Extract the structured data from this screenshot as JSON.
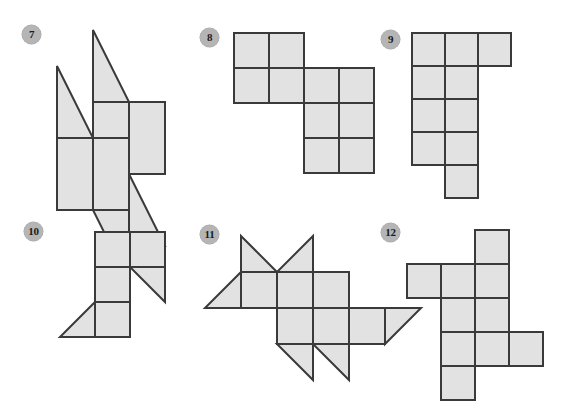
{
  "page": {
    "kind": "geometry-worksheet-figures",
    "background_color": "#ffffff",
    "width": 567,
    "height": 416
  },
  "style": {
    "face_fill": "#e2e2e2",
    "stroke_color": "#3a3a3a",
    "stroke_width": 2,
    "badge_fill": "#b5b5b5",
    "badge_text_color": "#1a1a1a"
  },
  "figures": [
    {
      "number": "7",
      "badge_label": "7",
      "badge_x": 22,
      "badge_y": 25,
      "cell": 36,
      "origin_x": 55,
      "origin_y": 28,
      "description": "net of squares and right triangles forming a pinwheel",
      "pieces": [
        {
          "name": "triangle-top",
          "type": "triangle",
          "points": "1,0 1,2 2,2"
        },
        {
          "name": "square-top-center",
          "type": "square",
          "points": "1,2 2,2 2,4 1,4"
        },
        {
          "name": "square-top-right",
          "type": "square",
          "points": "2,2 3,2 3,4 2,4"
        },
        {
          "name": "triangle-upper-left",
          "type": "triangle",
          "points": "0,1 1,3 0,3"
        },
        {
          "name": "square-mid-left",
          "type": "square",
          "points": "0,3 1,3 1,5 0,5"
        },
        {
          "name": "square-mid-center",
          "type": "square",
          "points": "1,3 2,3 2,5 1,5"
        },
        {
          "name": "triangle-right",
          "type": "triangle",
          "points": "2,4 3,6 2,6"
        },
        {
          "name": "triangle-bottom",
          "type": "triangle",
          "points": "1,5 2,5 2,7"
        }
      ]
    },
    {
      "number": "8",
      "badge_label": "8",
      "badge_x": 200,
      "badge_y": 28,
      "cell": 35,
      "origin_x": 232,
      "origin_y": 31,
      "description": "net of six squares in a staircase arrangement",
      "pieces": [
        {
          "name": "square-r0c0",
          "type": "square",
          "points": "0,0 1,0 1,1 0,1"
        },
        {
          "name": "square-r0c1",
          "type": "square",
          "points": "1,0 2,0 2,1 1,1"
        },
        {
          "name": "square-r1c0",
          "type": "square",
          "points": "0,1 1,1 1,2 0,2"
        },
        {
          "name": "square-r1c1",
          "type": "square",
          "points": "1,1 2,1 2,2 1,2"
        },
        {
          "name": "square-r1c2",
          "type": "square",
          "points": "2,1 3,1 3,2 2,2"
        },
        {
          "name": "square-r1c3",
          "type": "square",
          "points": "3,1 4,1 4,2 3,2"
        },
        {
          "name": "square-r2c2",
          "type": "square",
          "points": "2,2 3,2 3,3 2,3"
        },
        {
          "name": "square-r2c3",
          "type": "square",
          "points": "3,2 4,2 4,3 3,3"
        },
        {
          "name": "square-r3c2",
          "type": "square",
          "points": "2,3 3,3 3,4 2,4"
        },
        {
          "name": "square-r3c3",
          "type": "square",
          "points": "3,3 4,3 4,4 3,4"
        }
      ]
    },
    {
      "number": "9",
      "badge_label": "9",
      "badge_x": 381,
      "badge_y": 30,
      "cell": 33,
      "origin_x": 410,
      "origin_y": 31,
      "description": "net of squares: three across the top, a two-wide column, and one bottom square",
      "pieces": [
        {
          "name": "square-r0c0",
          "type": "square",
          "points": "0,0 1,0 1,1 0,1"
        },
        {
          "name": "square-r0c1",
          "type": "square",
          "points": "1,0 2,0 2,1 1,1"
        },
        {
          "name": "square-r0c2",
          "type": "square",
          "points": "2,0 3,0 3,1 2,1"
        },
        {
          "name": "square-r1c0",
          "type": "square",
          "points": "0,1 1,1 1,2 0,2"
        },
        {
          "name": "square-r1c1",
          "type": "square",
          "points": "1,1 2,1 2,2 1,2"
        },
        {
          "name": "square-r2c0",
          "type": "square",
          "points": "0,2 1,2 1,3 0,3"
        },
        {
          "name": "square-r2c1",
          "type": "square",
          "points": "1,2 2,2 2,3 1,3"
        },
        {
          "name": "square-r3c0",
          "type": "square",
          "points": "0,3 1,3 1,4 0,4"
        },
        {
          "name": "square-r3c1",
          "type": "square",
          "points": "1,3 2,3 2,4 1,4"
        },
        {
          "name": "square-r4c1",
          "type": "square",
          "points": "1,4 2,4 2,5 1,5"
        }
      ]
    },
    {
      "number": "10",
      "badge_label": "10",
      "badge_x": 24,
      "badge_y": 222,
      "cell": 35,
      "origin_x": 58,
      "origin_y": 230,
      "description": "net of four squares with two right triangles",
      "pieces": [
        {
          "name": "square-top-left",
          "type": "square",
          "points": "1,0 2,0 2,1 1,1"
        },
        {
          "name": "square-top-right",
          "type": "square",
          "points": "2,0 3,0 3,1 2,1"
        },
        {
          "name": "square-middle",
          "type": "square",
          "points": "1,1 2,1 2,2 1,2"
        },
        {
          "name": "triangle-right",
          "type": "triangle",
          "points": "2,1 3,1 3,2"
        },
        {
          "name": "triangle-bottom-left",
          "type": "triangle",
          "points": "1,2 1,3 0,3"
        },
        {
          "name": "square-bottom",
          "type": "square",
          "points": "1,2 2,2 2,3 1,3"
        }
      ]
    },
    {
      "number": "11",
      "badge_label": "11",
      "badge_x": 200,
      "badge_y": 225,
      "cell": 36,
      "origin_x": 203,
      "origin_y": 234,
      "description": "net of squares with four triangular flaps forming a star-like shape",
      "pieces": [
        {
          "name": "triangle-top-left-flap",
          "type": "triangle",
          "points": "1,0 2,1 1,1"
        },
        {
          "name": "triangle-top-right-flap",
          "type": "triangle",
          "points": "3,0 3,1 2,1"
        },
        {
          "name": "triangle-left-flap",
          "type": "triangle",
          "points": "1,1 1,2 0,2"
        },
        {
          "name": "square-r1c1",
          "type": "square",
          "points": "1,1 2,1 2,2 1,2"
        },
        {
          "name": "square-r1c2",
          "type": "square",
          "points": "2,1 3,1 3,2 2,2"
        },
        {
          "name": "square-r1c3",
          "type": "square",
          "points": "3,1 4,1 4,2 3,2"
        },
        {
          "name": "square-r2c2",
          "type": "square",
          "points": "2,2 3,2 3,3 2,3"
        },
        {
          "name": "square-r2c3",
          "type": "square",
          "points": "3,2 4,2 4,3 3,3"
        },
        {
          "name": "square-r2c4",
          "type": "square",
          "points": "4,2 5,2 5,3 4,3"
        },
        {
          "name": "triangle-right-flap",
          "type": "triangle",
          "points": "5,2 6,2 5,3"
        },
        {
          "name": "triangle-bottom-left-flap",
          "type": "triangle",
          "points": "3,3 3,4 2,3"
        },
        {
          "name": "triangle-bottom-right-flap",
          "type": "triangle",
          "points": "3,3 4,3 4,4"
        }
      ]
    },
    {
      "number": "12",
      "badge_label": "12",
      "badge_x": 381,
      "badge_y": 223,
      "cell": 34,
      "origin_x": 405,
      "origin_y": 228,
      "description": "net of ten squares in a cross-like arrangement",
      "pieces": [
        {
          "name": "square-r0c2",
          "type": "square",
          "points": "2,0 3,0 3,1 2,1"
        },
        {
          "name": "square-r1c0",
          "type": "square",
          "points": "0,1 1,1 1,2 0,2"
        },
        {
          "name": "square-r1c1",
          "type": "square",
          "points": "1,1 2,1 2,2 1,2"
        },
        {
          "name": "square-r1c2",
          "type": "square",
          "points": "2,1 3,1 3,2 2,2"
        },
        {
          "name": "square-r2c1",
          "type": "square",
          "points": "1,2 2,2 2,3 1,3"
        },
        {
          "name": "square-r2c2",
          "type": "square",
          "points": "2,2 3,2 3,3 2,3"
        },
        {
          "name": "square-r3c1",
          "type": "square",
          "points": "1,3 2,3 2,4 1,4"
        },
        {
          "name": "square-r3c2",
          "type": "square",
          "points": "2,3 3,3 3,4 2,4"
        },
        {
          "name": "square-r3c3",
          "type": "square",
          "points": "3,3 4,3 4,4 3,4"
        },
        {
          "name": "square-r4c1",
          "type": "square",
          "points": "1,4 2,4 2,5 1,5"
        }
      ]
    }
  ]
}
